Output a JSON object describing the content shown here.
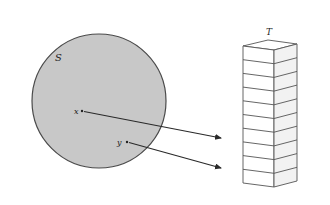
{
  "figure": {
    "set_label": "S",
    "table_label": "T",
    "points": [
      {
        "label": "x",
        "cx": 82,
        "cy": 111,
        "arrow_to": [
          223,
          138
        ]
      },
      {
        "label": "y",
        "cx": 127,
        "cy": 142,
        "arrow_to": [
          223,
          168
        ]
      }
    ],
    "table_slots": 10,
    "colors": {
      "set_fill": "#c8c8c8",
      "set_stroke": "#4a4a4a",
      "line": "#2a2a2a",
      "box_front": "#ffffff",
      "box_side": "#f2f2f2"
    }
  }
}
